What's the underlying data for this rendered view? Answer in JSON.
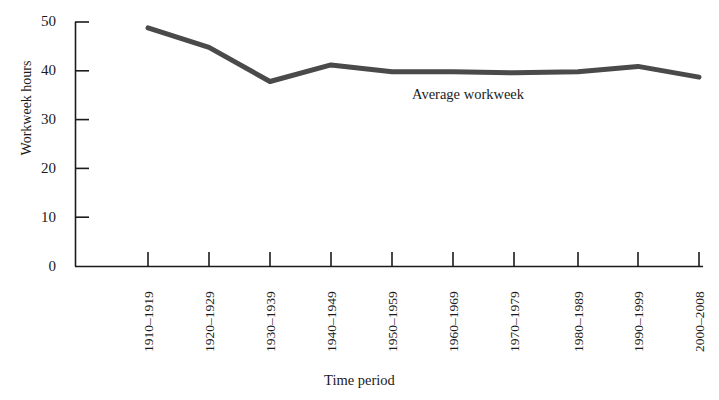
{
  "figure": {
    "top_cropped_caption": "",
    "background_color": "#ffffff",
    "ink_color": "#1b1b1b",
    "series_color": "#4a4a4a"
  },
  "axes": {
    "y_title": "Workweek hours",
    "x_title": "Time period",
    "y_ticks": [
      "0",
      "10",
      "20",
      "30",
      "40",
      "50"
    ],
    "x_ticks": [
      "1910–1919",
      "1920–1929",
      "1930–1939",
      "1940–1949",
      "1950–1959",
      "1960–1969",
      "1970–1979",
      "1980–1989",
      "1990–1999",
      "2000–2008"
    ]
  },
  "annotations": {
    "series_label": "Average workweek"
  },
  "chart_data": {
    "type": "line",
    "title": "",
    "xlabel": "Time period",
    "ylabel": "Workweek hours",
    "categories": [
      "1910–1919",
      "1920–1929",
      "1930–1939",
      "1940–1949",
      "1950–1959",
      "1960–1969",
      "1970–1979",
      "1980–1989",
      "1990–1999",
      "2000–2008"
    ],
    "series": [
      {
        "name": "Average workweek",
        "values": [
          48.8,
          44.8,
          37.8,
          41.2,
          39.8,
          39.8,
          39.6,
          39.8,
          40.9,
          38.7
        ]
      }
    ],
    "ylim": [
      0,
      50
    ],
    "ytick_step": 10,
    "grid": false,
    "legend": "inline-annotation",
    "legend_position": "inside-center",
    "line_width_px": 5,
    "markers": false
  }
}
